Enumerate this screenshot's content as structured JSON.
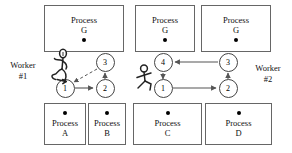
{
  "diagram": {
    "colors": {
      "stroke": "#555555",
      "box_border": "#666666",
      "node_border": "#444444",
      "text": "#111111",
      "background": "#ffffff"
    },
    "top_boxes": [
      {
        "id": "top-g-left",
        "line1": "Process",
        "line2": "G",
        "x": 44,
        "y": 5,
        "w": 80,
        "h": 47
      },
      {
        "id": "top-g-mid",
        "line1": "Process",
        "line2": "G",
        "x": 135,
        "y": 5,
        "w": 60,
        "h": 47
      },
      {
        "id": "top-g-right",
        "line1": "Process",
        "line2": "G",
        "x": 201,
        "y": 5,
        "w": 70,
        "h": 47
      }
    ],
    "bottom_boxes": [
      {
        "id": "bottom-a",
        "line1": "Process",
        "line2": "A",
        "x": 44,
        "y": 103,
        "w": 42,
        "h": 42
      },
      {
        "id": "bottom-b",
        "line1": "Process",
        "line2": "B",
        "x": 88,
        "y": 103,
        "w": 38,
        "h": 42
      },
      {
        "id": "bottom-c",
        "line1": "Process",
        "line2": "C",
        "x": 133,
        "y": 103,
        "w": 69,
        "h": 42
      },
      {
        "id": "bottom-d",
        "line1": "Process",
        "line2": "D",
        "x": 205,
        "y": 103,
        "w": 67,
        "h": 42
      }
    ],
    "nodes": [
      {
        "id": "w1-n3",
        "label": "3",
        "cx": 105,
        "cy": 62
      },
      {
        "id": "w1-n1",
        "label": "1",
        "cx": 65,
        "cy": 88
      },
      {
        "id": "w1-n2",
        "label": "2",
        "cx": 105,
        "cy": 88
      },
      {
        "id": "w2-n4",
        "label": "4",
        "cx": 163,
        "cy": 62
      },
      {
        "id": "w2-n3",
        "label": "3",
        "cx": 228,
        "cy": 62
      },
      {
        "id": "w2-n1",
        "label": "1",
        "cx": 163,
        "cy": 88
      },
      {
        "id": "w2-n2",
        "label": "2",
        "cx": 228,
        "cy": 88
      }
    ],
    "workers": [
      {
        "id": "worker-1",
        "line1": "Worker",
        "line2": "#1",
        "label_x": 2,
        "label_y": 62
      },
      {
        "id": "worker-2",
        "line1": "Worker",
        "line2": "#2",
        "label_x": 247,
        "label_y": 72
      }
    ],
    "edges": [
      {
        "id": "edge-w1-1-to-2",
        "style": "solid",
        "from": "w1-n1",
        "to": "w1-n2"
      },
      {
        "id": "edge-w1-2-to-3",
        "style": "solid",
        "from": "w1-n2",
        "to": "w1-n3"
      },
      {
        "id": "edge-w1-3-to-1",
        "style": "dashed",
        "from": "w1-n3",
        "to": "w1-n1"
      },
      {
        "id": "edge-w2-1-to-2",
        "style": "solid",
        "from": "w2-n1",
        "to": "w2-n2"
      },
      {
        "id": "edge-w2-2-to-3",
        "style": "solid",
        "from": "w2-n2",
        "to": "w2-n3"
      },
      {
        "id": "edge-w2-3-to-4",
        "style": "solid",
        "from": "w2-n3",
        "to": "w2-n4"
      },
      {
        "id": "edge-w2-4-to-1",
        "style": "solid",
        "from": "w2-n4",
        "to": "w2-n1"
      }
    ]
  }
}
